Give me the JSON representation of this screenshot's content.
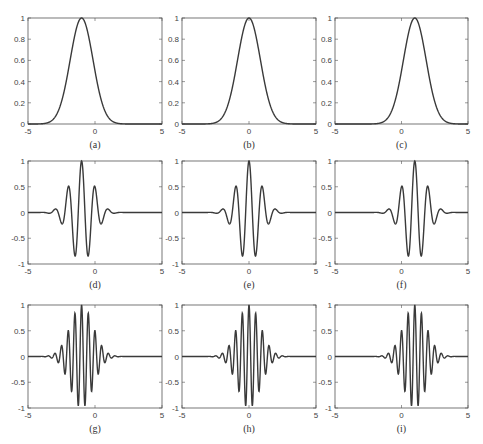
{
  "figure": {
    "line_color": "#3a3a3a",
    "axis_color": "#555555",
    "background": "#ffffff"
  },
  "chart_data": [
    {
      "id": "a",
      "caption": "(a)",
      "type": "line",
      "func": "gaussian",
      "center": -1,
      "sigma": 0.85,
      "freq": 0,
      "xlim": [
        -5,
        5
      ],
      "ylim": [
        0,
        1
      ],
      "xticks": [
        "-5",
        "0",
        "5"
      ],
      "yticks": [
        "0",
        "0.2",
        "0.4",
        "0.6",
        "0.8",
        "1"
      ],
      "description": "Gaussian envelope centered at x=-1, peak 1"
    },
    {
      "id": "b",
      "caption": "(b)",
      "type": "line",
      "func": "gaussian",
      "center": 0,
      "sigma": 0.85,
      "freq": 0,
      "xlim": [
        -5,
        5
      ],
      "ylim": [
        0,
        1
      ],
      "xticks": [
        "-5",
        "0",
        "5"
      ],
      "yticks": [
        "0",
        "0.2",
        "0.4",
        "0.6",
        "0.8",
        "1"
      ],
      "description": "Gaussian envelope centered at x=0, peak 1"
    },
    {
      "id": "c",
      "caption": "(c)",
      "type": "line",
      "func": "gaussian",
      "center": 1,
      "sigma": 0.85,
      "freq": 0,
      "xlim": [
        -5,
        5
      ],
      "ylim": [
        0,
        1
      ],
      "xticks": [
        "-5",
        "0",
        "5"
      ],
      "yticks": [
        "0",
        "0.2",
        "0.4",
        "0.6",
        "0.8",
        "1"
      ],
      "description": "Gaussian envelope centered at x=1, peak 1"
    },
    {
      "id": "d",
      "caption": "(d)",
      "type": "line",
      "func": "gabor",
      "center": -1,
      "sigma": 0.85,
      "freq": 1.0,
      "xlim": [
        -5,
        5
      ],
      "ylim": [
        -1,
        1
      ],
      "xticks": [
        "-5",
        "0",
        "5"
      ],
      "yticks": [
        "-1",
        "-0.5",
        "0",
        "0.5",
        "1"
      ],
      "description": "Modulated cosine wavelet centered at x=-1, low frequency"
    },
    {
      "id": "e",
      "caption": "(e)",
      "type": "line",
      "func": "gabor",
      "center": 0,
      "sigma": 0.85,
      "freq": 1.0,
      "xlim": [
        -5,
        5
      ],
      "ylim": [
        -1,
        1
      ],
      "xticks": [
        "-5",
        "0",
        "5"
      ],
      "yticks": [
        "-1",
        "-0.5",
        "0",
        "0.5",
        "1"
      ],
      "description": "Modulated cosine wavelet centered at x=0, low frequency"
    },
    {
      "id": "f",
      "caption": "(f)",
      "type": "line",
      "func": "gabor",
      "center": 1,
      "sigma": 0.85,
      "freq": 1.0,
      "xlim": [
        -5,
        5
      ],
      "ylim": [
        -1,
        1
      ],
      "xticks": [
        "-5",
        "0",
        "5"
      ],
      "yticks": [
        "-1",
        "-0.5",
        "0",
        "0.5",
        "1"
      ],
      "description": "Modulated cosine wavelet centered at x=1, low frequency"
    },
    {
      "id": "g",
      "caption": "(g)",
      "type": "line",
      "func": "gabor",
      "center": -1,
      "sigma": 0.85,
      "freq": 2.0,
      "xlim": [
        -5,
        5
      ],
      "ylim": [
        -1,
        1
      ],
      "xticks": [
        "-5",
        "0",
        "5"
      ],
      "yticks": [
        "-1",
        "-0.5",
        "0",
        "0.5",
        "1"
      ],
      "description": "Modulated cosine wavelet centered at x=-1, high frequency"
    },
    {
      "id": "h",
      "caption": "(h)",
      "type": "line",
      "func": "gabor",
      "center": 0,
      "sigma": 0.85,
      "freq": 2.0,
      "xlim": [
        -5,
        5
      ],
      "ylim": [
        -1,
        1
      ],
      "xticks": [
        "-5",
        "0",
        "5"
      ],
      "yticks": [
        "-1",
        "-0.5",
        "0",
        "0.5",
        "1"
      ],
      "description": "Modulated cosine wavelet centered at x=0, high frequency"
    },
    {
      "id": "i",
      "caption": "(i)",
      "type": "line",
      "func": "gabor",
      "center": 1,
      "sigma": 0.85,
      "freq": 2.0,
      "xlim": [
        -5,
        5
      ],
      "ylim": [
        -1,
        1
      ],
      "xticks": [
        "-5",
        "0",
        "5"
      ],
      "yticks": [
        "-1",
        "-0.5",
        "0",
        "0.5",
        "1"
      ],
      "description": "Modulated cosine wavelet centered at x=1, high frequency"
    }
  ]
}
